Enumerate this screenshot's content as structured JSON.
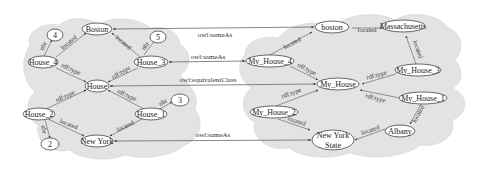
{
  "left_graph": {
    "nodes": {
      "boston": "Boston",
      "house_4": "House_4",
      "house_3": "House_3",
      "house": "House",
      "house_2": "House_2",
      "house_1": "House_1",
      "new_york": "New York",
      "n4": "4",
      "n5": "5",
      "n3": "3",
      "n2": "2"
    },
    "edges": {
      "nbr_h4": "nbr",
      "nbr_h3": "nbr",
      "nbr_h1": "nbr",
      "nbr_h2": "nbr",
      "located_h4": "located",
      "located_h3": "located",
      "located_h2": "located",
      "located_h1": "located",
      "type_h4": "rdf:type",
      "type_h3": "rdf:type",
      "type_h2": "rdf:type",
      "type_h1": "rdf:type"
    }
  },
  "right_graph": {
    "nodes": {
      "boston": "boston",
      "massachusetts": "Massachusetts",
      "my_house_4": "My_House_4",
      "my_house_3": "My_House_3",
      "my_house": "My_House",
      "my_house_2": "My_House_2",
      "my_house_1": "My_House_1",
      "new_york_state_l1": "New York",
      "new_york_state_l2": "State",
      "albany": "Albany"
    },
    "edges": {
      "located_boston_mass": "located",
      "located_mh4": "located",
      "located_mass_mh3": "located",
      "type_mh4": "rdf:type",
      "type_mh3": "rdf:type",
      "type_mh2": "rdf:type",
      "type_mh1": "rdf:type",
      "located_mh2": "located",
      "located_albany": "located",
      "located_mh1_albany": "located"
    }
  },
  "links": {
    "same_boston": "owl:sameAs",
    "same_house": "owl:sameAs",
    "equiv_class": "owl:equivalentClass",
    "same_newyork": "owl:sameAs"
  }
}
